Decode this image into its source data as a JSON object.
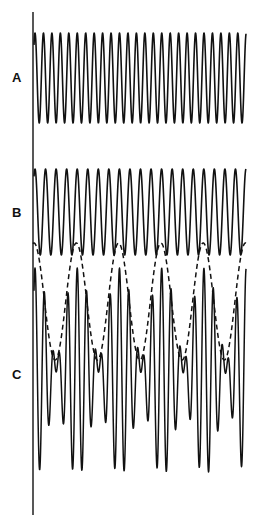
{
  "figure": {
    "background": "#ffffff",
    "stroke_color": "#111111",
    "axis": {
      "x": 33,
      "y_start": 12,
      "y_end": 515
    },
    "panels": [
      {
        "id": "A",
        "label": "A",
        "label_x": 12,
        "label_y": 71,
        "wave": {
          "type": "sine",
          "x_start": 34,
          "x_end": 246,
          "center_y": 78,
          "amplitude": 45,
          "period": 8.45,
          "phase_peak_x": 35
        }
      },
      {
        "id": "B",
        "label": "B",
        "label_x": 12,
        "label_y": 206,
        "wave": {
          "type": "sine",
          "x_start": 34,
          "x_end": 246,
          "center_y": 212,
          "amplitude": 43,
          "period": 10.55,
          "phase_peak_x": 35
        }
      },
      {
        "id": "C",
        "label": "C",
        "label_x": 12,
        "label_y": 368,
        "wave": {
          "type": "sum",
          "x_start": 34,
          "x_end": 246,
          "center_y": 372,
          "amplitude_each": 52,
          "periods": [
            8.45,
            10.55
          ],
          "phase_peak_x": 35
        },
        "envelope": {
          "type": "dashed",
          "x_start": 33,
          "x_end": 246,
          "top_y": 243,
          "bottom_y": 360,
          "period": 42.3,
          "phase_peak_x": 34
        }
      }
    ]
  },
  "footer": {
    "text": ""
  }
}
